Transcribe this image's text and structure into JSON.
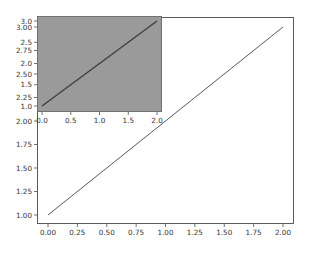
{
  "chart_data": [
    {
      "name": "main",
      "type": "line",
      "title": "",
      "xlabel": "",
      "ylabel": "",
      "x": [
        0,
        2
      ],
      "series": [
        {
          "name": "line",
          "values": [
            1,
            3
          ],
          "color": "#5a5a5a"
        }
      ],
      "xlim": [
        -0.1,
        2.1
      ],
      "ylim": [
        0.9,
        3.1
      ],
      "xticks": [
        "0.00",
        "0.25",
        "0.50",
        "0.75",
        "1.00",
        "1.25",
        "1.50",
        "1.75",
        "2.00"
      ],
      "yticks": [
        "1.00",
        "1.25",
        "1.50",
        "1.75",
        "2.00",
        "2.25",
        "2.50",
        "2.75",
        "3.00"
      ],
      "grid": false,
      "background": "#ffffff"
    },
    {
      "name": "inset",
      "type": "line",
      "title": "",
      "xlabel": "",
      "ylabel": "",
      "x": [
        0,
        2
      ],
      "series": [
        {
          "name": "line",
          "values": [
            1,
            3
          ],
          "color": "#3c3c3c"
        }
      ],
      "xlim": [
        -0.1,
        2.1
      ],
      "ylim": [
        0.9,
        3.1
      ],
      "xticks": [
        "0.0",
        "0.5",
        "1.0",
        "1.5",
        "2.0"
      ],
      "yticks": [
        "1.0",
        "1.5",
        "2.0",
        "2.5",
        "3.0"
      ],
      "grid": false,
      "background": "#9a9a9a"
    }
  ]
}
